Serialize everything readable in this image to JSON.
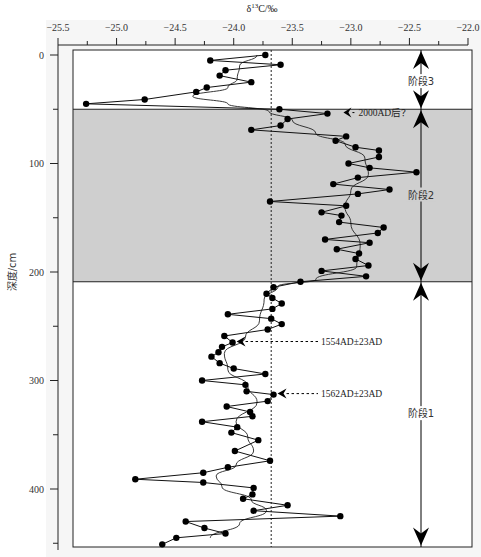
{
  "chart_data": {
    "type": "line",
    "title": "δ13C/‰",
    "xlabel": "δ13C/‰",
    "ylabel": "深度/cm",
    "x_axis_position": "top",
    "y_inverted": true,
    "xlim": [
      -25.5,
      -22.0
    ],
    "ylim": [
      0,
      455
    ],
    "x_ticks": [
      -25.5,
      -25.0,
      -24.5,
      -24.0,
      -23.5,
      -23.0,
      -22.5,
      -22.0
    ],
    "x_tick_labels": [
      "−25.5",
      "−25.0",
      "−24.5",
      "−24.0",
      "−23.5",
      "−23.0",
      "−22.5",
      "−22.0"
    ],
    "y_ticks": [
      0,
      100,
      200,
      300,
      400
    ],
    "y_tick_labels": [
      "0",
      "100",
      "200",
      "300",
      "400"
    ],
    "reference_line": {
      "x": -23.68,
      "style": "dashed"
    },
    "stages": [
      {
        "label": "阶段3",
        "from": 0,
        "to": 50,
        "shaded": false
      },
      {
        "label": "阶段2",
        "from": 50,
        "to": 209,
        "shaded": true
      },
      {
        "label": "阶段1",
        "from": 209,
        "to": 453,
        "shaded": false
      }
    ],
    "annotations": [
      {
        "text": "2000AD后？",
        "x": -23.2,
        "depth": 54
      },
      {
        "text": "1554AD±23AD",
        "x": -24.01,
        "depth": 265
      },
      {
        "text": "1562AD±23AD",
        "x": -23.66,
        "depth": 313
      }
    ],
    "series": [
      {
        "name": "δ13C measured",
        "marker": "circle",
        "points": [
          [
            -23.73,
            0
          ],
          [
            -24.2,
            5
          ],
          [
            -23.6,
            9
          ],
          [
            -24.07,
            14
          ],
          [
            -24.12,
            19
          ],
          [
            -23.85,
            25
          ],
          [
            -24.23,
            30
          ],
          [
            -24.32,
            34
          ],
          [
            -24.76,
            41
          ],
          [
            -25.26,
            45
          ],
          [
            -23.61,
            50
          ],
          [
            -23.2,
            54
          ],
          [
            -23.54,
            59
          ],
          [
            -23.6,
            65
          ],
          [
            -23.85,
            69
          ],
          [
            -23.04,
            75
          ],
          [
            -23.13,
            79
          ],
          [
            -22.96,
            85
          ],
          [
            -22.76,
            88
          ],
          [
            -22.76,
            94
          ],
          [
            -23.02,
            100
          ],
          [
            -22.84,
            104
          ],
          [
            -22.44,
            108
          ],
          [
            -22.94,
            113
          ],
          [
            -23.15,
            119
          ],
          [
            -22.67,
            124
          ],
          [
            -22.94,
            128
          ],
          [
            -23.69,
            135
          ],
          [
            -23.04,
            139
          ],
          [
            -23.25,
            145
          ],
          [
            -23.08,
            148
          ],
          [
            -23.1,
            154
          ],
          [
            -22.72,
            159
          ],
          [
            -22.77,
            164
          ],
          [
            -23.22,
            170
          ],
          [
            -22.84,
            173
          ],
          [
            -23.12,
            179
          ],
          [
            -22.93,
            183
          ],
          [
            -22.96,
            188
          ],
          [
            -22.85,
            194
          ],
          [
            -23.25,
            199
          ],
          [
            -22.87,
            204
          ],
          [
            -23.43,
            209
          ],
          [
            -23.66,
            214
          ],
          [
            -23.72,
            220
          ],
          [
            -23.67,
            224
          ],
          [
            -23.59,
            229
          ],
          [
            -23.67,
            234
          ],
          [
            -24.05,
            239
          ],
          [
            -23.68,
            243
          ],
          [
            -23.59,
            248
          ],
          [
            -23.71,
            253
          ],
          [
            -24.08,
            259
          ],
          [
            -24.01,
            265
          ],
          [
            -24.1,
            269
          ],
          [
            -24.13,
            274
          ],
          [
            -24.19,
            278
          ],
          [
            -24.12,
            284
          ],
          [
            -24.0,
            289
          ],
          [
            -23.73,
            294
          ],
          [
            -24.27,
            300
          ],
          [
            -23.9,
            304
          ],
          [
            -23.89,
            310
          ],
          [
            -23.66,
            313
          ],
          [
            -23.71,
            319
          ],
          [
            -24.06,
            324
          ],
          [
            -23.86,
            329
          ],
          [
            -23.84,
            333
          ],
          [
            -24.27,
            338
          ],
          [
            -23.97,
            343
          ],
          [
            -24.02,
            348
          ],
          [
            -23.79,
            355
          ],
          [
            -23.99,
            365
          ],
          [
            -23.69,
            374
          ],
          [
            -24.05,
            380
          ],
          [
            -24.26,
            385
          ],
          [
            -24.84,
            391
          ],
          [
            -24.26,
            394
          ],
          [
            -23.83,
            399
          ],
          [
            -23.84,
            405
          ],
          [
            -23.92,
            409
          ],
          [
            -23.54,
            415
          ],
          [
            -23.83,
            420
          ],
          [
            -23.09,
            425
          ],
          [
            -24.41,
            430
          ],
          [
            -24.25,
            436
          ],
          [
            -24.07,
            441
          ],
          [
            -24.49,
            445
          ],
          [
            -24.61,
            451
          ]
        ]
      },
      {
        "name": "smoothed trend",
        "marker": "none",
        "points": [
          [
            -23.8,
            0
          ],
          [
            -23.95,
            10
          ],
          [
            -23.97,
            22
          ],
          [
            -24.05,
            30
          ],
          [
            -24.35,
            38
          ],
          [
            -24.05,
            45
          ],
          [
            -23.7,
            52
          ],
          [
            -23.5,
            60
          ],
          [
            -23.3,
            72
          ],
          [
            -23.05,
            82
          ],
          [
            -22.88,
            95
          ],
          [
            -22.85,
            110
          ],
          [
            -23.0,
            125
          ],
          [
            -23.05,
            140
          ],
          [
            -23.0,
            155
          ],
          [
            -22.92,
            175
          ],
          [
            -22.95,
            195
          ],
          [
            -23.3,
            207
          ],
          [
            -23.62,
            213
          ],
          [
            -23.74,
            225
          ],
          [
            -23.78,
            245
          ],
          [
            -23.9,
            260
          ],
          [
            -24.08,
            275
          ],
          [
            -24.05,
            290
          ],
          [
            -23.88,
            305
          ],
          [
            -23.8,
            320
          ],
          [
            -23.98,
            338
          ],
          [
            -23.88,
            352
          ],
          [
            -23.83,
            365
          ],
          [
            -23.98,
            378
          ],
          [
            -24.15,
            388
          ],
          [
            -24.1,
            398
          ],
          [
            -23.85,
            410
          ],
          [
            -23.72,
            420
          ],
          [
            -23.95,
            432
          ],
          [
            -24.2,
            445
          ]
        ]
      }
    ]
  }
}
